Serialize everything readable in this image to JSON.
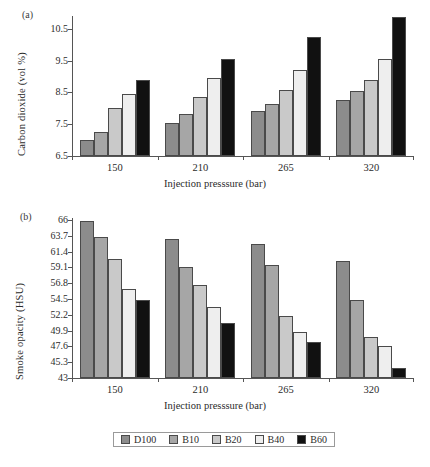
{
  "figure": {
    "panels": [
      {
        "tag": "(a)"
      },
      {
        "tag": "(b)"
      }
    ],
    "legend": {
      "items": [
        {
          "label": "D100",
          "color": "#8c8c8c"
        },
        {
          "label": "B10",
          "color": "#a6a6a6"
        },
        {
          "label": "B20",
          "color": "#c9c9c9"
        },
        {
          "label": "B40",
          "color": "#eeeeee"
        },
        {
          "label": "B60",
          "color": "#111111"
        }
      ]
    }
  },
  "chart_data": [
    {
      "type": "bar",
      "panel": "(a)",
      "title": "",
      "xlabel": "Injection presssure (bar)",
      "ylabel": "Carbon dioxide (vol %)",
      "categories": [
        "150",
        "210",
        "265",
        "320"
      ],
      "ylim": [
        6.5,
        10.9
      ],
      "yticks": [
        "6.5",
        "7.5",
        "8.5",
        "9.5",
        "10.5"
      ],
      "ytickvals": [
        6.5,
        7.5,
        8.5,
        9.5,
        10.5
      ],
      "grid": false,
      "legend_position": "bottom",
      "series": [
        {
          "name": "D100",
          "color": "#8c8c8c",
          "values": [
            7.0,
            7.54,
            7.9,
            8.25
          ]
        },
        {
          "name": "B10",
          "color": "#a6a6a6",
          "values": [
            7.27,
            7.83,
            8.14,
            8.55
          ]
        },
        {
          "name": "B20",
          "color": "#c9c9c9",
          "values": [
            8.02,
            8.37,
            8.56,
            8.88
          ]
        },
        {
          "name": "B40",
          "color": "#eeeeee",
          "values": [
            8.44,
            8.96,
            9.21,
            9.55
          ]
        },
        {
          "name": "B60",
          "color": "#111111",
          "values": [
            8.88,
            9.54,
            10.23,
            10.87
          ]
        }
      ]
    },
    {
      "type": "bar",
      "panel": "(b)",
      "title": "",
      "xlabel": "Injection presssure (bar)",
      "ylabel": "Smoke opacity (HSU)",
      "categories": [
        "150",
        "210",
        "265",
        "320"
      ],
      "ylim": [
        43,
        66.3
      ],
      "yticks": [
        "43",
        "45.3",
        "47.6",
        "49.9",
        "52.2",
        "54.5",
        "56.8",
        "59.1",
        "61.4",
        "63.7",
        "66"
      ],
      "ytickvals": [
        43,
        45.3,
        47.6,
        49.9,
        52.2,
        54.5,
        56.8,
        59.1,
        61.4,
        63.7,
        66
      ],
      "grid": false,
      "legend_position": "bottom",
      "series": [
        {
          "name": "D100",
          "color": "#8c8c8c",
          "values": [
            65.8,
            63.3,
            62.5,
            60.0
          ]
        },
        {
          "name": "B10",
          "color": "#a6a6a6",
          "values": [
            63.6,
            59.2,
            59.4,
            54.4
          ]
        },
        {
          "name": "B20",
          "color": "#c9c9c9",
          "values": [
            60.3,
            56.5,
            52.1,
            49.0
          ]
        },
        {
          "name": "B40",
          "color": "#eeeeee",
          "values": [
            56.0,
            53.3,
            49.7,
            47.6
          ]
        },
        {
          "name": "B60",
          "color": "#111111",
          "values": [
            54.4,
            51.0,
            48.2,
            44.4
          ]
        }
      ]
    }
  ]
}
